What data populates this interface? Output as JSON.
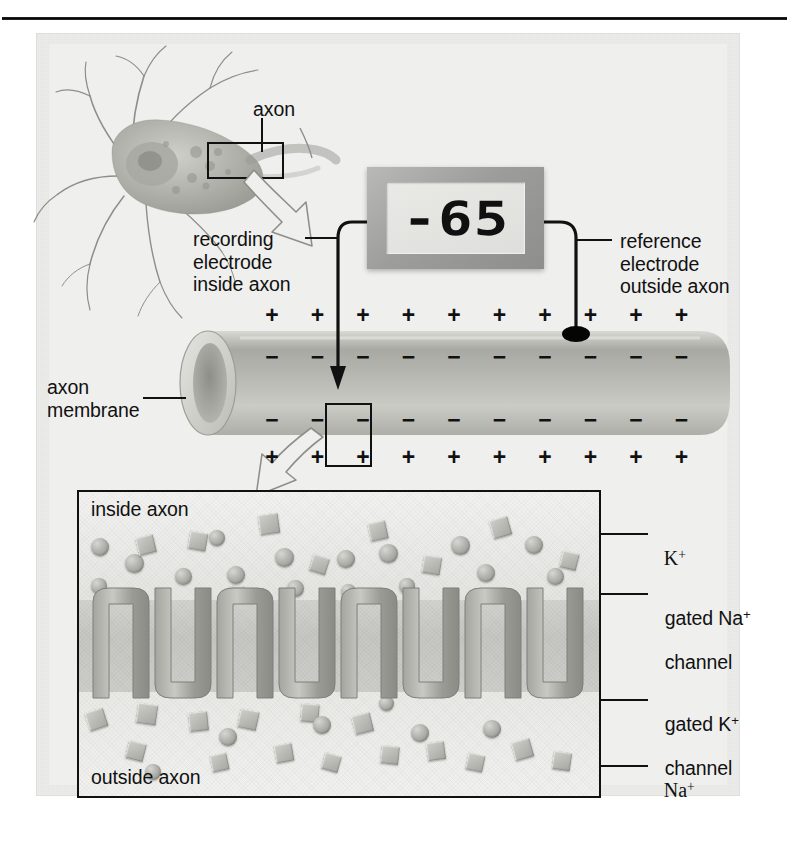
{
  "figure": {
    "title_text": "",
    "background_color": "#ececeb",
    "ink_color": "#111111"
  },
  "neuron": {
    "axon_label": "axon",
    "recording_electrode_label": "recording\nelectrode\ninside axon",
    "box_highlight_name": "axon-segment-box"
  },
  "voltmeter": {
    "value": "-65",
    "unit_implied": "mV",
    "bezel_color": "#9d9d9b",
    "screen_color": "#e4e4e1",
    "reference_electrode_label": "reference\nelectrode\noutside axon"
  },
  "axon": {
    "membrane_label": "axon\nmembrane",
    "outer_charge": "+",
    "inner_charge": "−",
    "outer_charge_count": 10,
    "inner_charge_count": 10,
    "highlight_box_name": "membrane-patch-box"
  },
  "detail_panel": {
    "inside_label": "inside axon",
    "outside_label": "outside axon",
    "callouts": [
      {
        "key": "k_ion",
        "label": "K",
        "sup": "+",
        "serif": true
      },
      {
        "key": "na_channel",
        "label": "gated Na",
        "sup": "+",
        "serif": false,
        "second_line": "channel"
      },
      {
        "key": "k_channel",
        "label": "gated K",
        "sup": "+",
        "serif": false,
        "second_line": "channel"
      },
      {
        "key": "na_ion",
        "label": "Na",
        "sup": "+",
        "serif": true
      }
    ],
    "ion_shapes": {
      "potassium": "sphere",
      "sodium": "cube"
    },
    "channel_types": [
      "gated Na+ channel",
      "gated K+ channel"
    ],
    "channel_pairs": 4
  }
}
